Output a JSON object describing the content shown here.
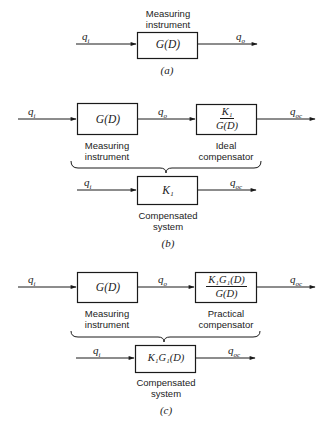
{
  "panel_a": {
    "top_label_line1": "Measuring",
    "top_label_line2": "instrument",
    "input_signal": "q",
    "input_sub": "i",
    "block": "G(D)",
    "output_signal": "q",
    "output_sub": "o",
    "caption": "(a)"
  },
  "panel_b": {
    "input_signal": "q",
    "input_sub": "i",
    "block1": "G(D)",
    "mid_signal": "q",
    "mid_sub": "o",
    "block2_num": "K₁",
    "block2_den": "G(D)",
    "output_signal": "q",
    "output_sub": "oc",
    "block1_label_line1": "Measuring",
    "block1_label_line2": "instrument",
    "block2_label_line1": "Ideal",
    "block2_label_line2": "compensator",
    "combined_input_signal": "q",
    "combined_input_sub": "i",
    "combined_block": "K₁",
    "combined_output_signal": "q",
    "combined_output_sub": "oc",
    "combined_label_line1": "Compensated",
    "combined_label_line2": "system",
    "caption": "(b)"
  },
  "panel_c": {
    "input_signal": "q",
    "input_sub": "i",
    "block1": "G(D)",
    "mid_signal": "q",
    "mid_sub": "o",
    "block2_num": "K₁G₁(D)",
    "block2_den": "G(D)",
    "output_signal": "q",
    "output_sub": "oc",
    "block1_label_line1": "Measuring",
    "block1_label_line2": "instrument",
    "block2_label_line1": "Practical",
    "block2_label_line2": "compensator",
    "combined_input_signal": "q",
    "combined_input_sub": "i",
    "combined_block": "K₁G₁(D)",
    "combined_output_signal": "q",
    "combined_output_sub": "oc",
    "combined_label_line1": "Compensated",
    "combined_label_line2": "system",
    "caption": "(c)"
  }
}
